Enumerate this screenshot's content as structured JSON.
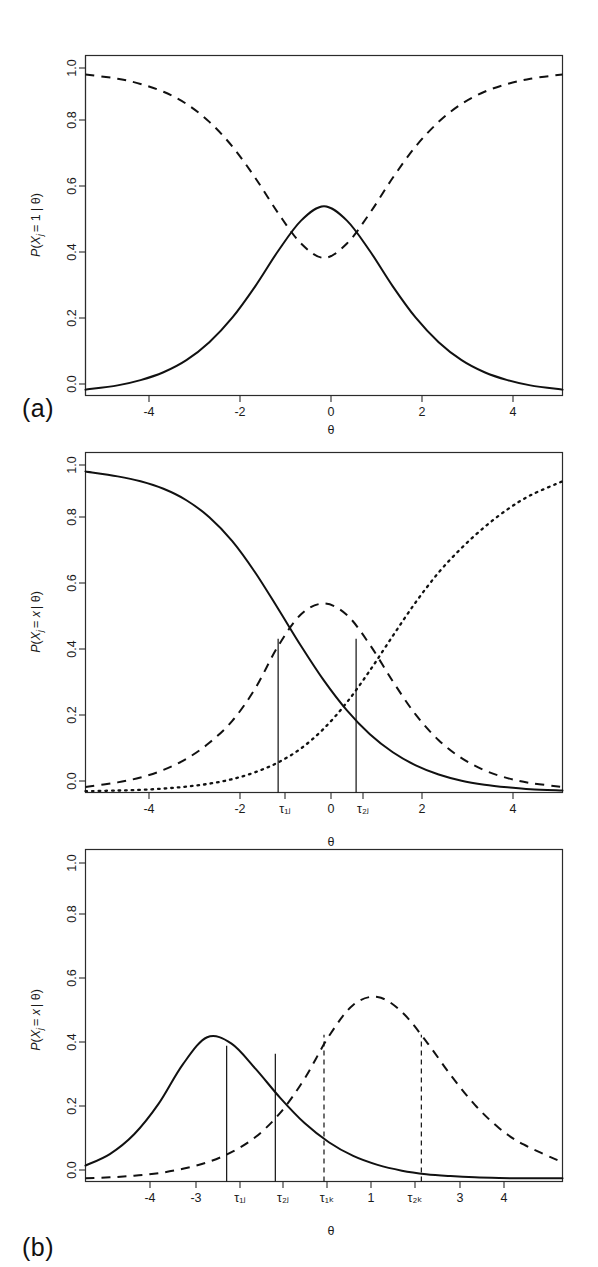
{
  "figure": {
    "panels": [
      {
        "tag": "(a)",
        "ylabel": "P(Xⱼ = 1 | θ)",
        "xlabel": "θ",
        "xticks": [
          "-4",
          "-2",
          "0",
          "2",
          "4"
        ],
        "xtick_values": [
          -4,
          -2,
          0,
          2,
          4
        ],
        "yticks": [
          "0.0",
          "0.2",
          "0.4",
          "0.6",
          "0.8",
          "1.0"
        ],
        "ytick_values": [
          0.0,
          0.2,
          0.4,
          0.6,
          0.8,
          1.0
        ]
      },
      {
        "tag": "(b)",
        "ylabel": "P(Xⱼ = x | θ)",
        "xlabel": "θ",
        "xticks": [
          "-4",
          "-2",
          "τ₁ⱼ",
          "0",
          "τ₂ⱼ",
          "2",
          "4"
        ],
        "xtick_values": [
          -4,
          -2,
          -1,
          0,
          0.7,
          2,
          4
        ],
        "yticks": [
          "0.0",
          "0.2",
          "0.4",
          "0.6",
          "0.8",
          "1.0"
        ],
        "ytick_values": [
          0.0,
          0.2,
          0.4,
          0.6,
          0.8,
          1.0
        ]
      },
      {
        "tag": "(c)",
        "ylabel": "P(Xⱼ = x | θ)",
        "xlabel": "θ",
        "xticks": [
          "-4",
          "-3",
          "τ₁ⱼ",
          "τ₂ⱼ",
          "τ₁ₖ",
          "1",
          "τ₂ₖ",
          "3",
          "4"
        ],
        "xtick_values": [
          -4,
          -3,
          -2,
          -1,
          0,
          1,
          2,
          3,
          4
        ],
        "yticks": [
          "0.0",
          "0.2",
          "0.4",
          "0.6",
          "0.8",
          "1.0"
        ],
        "ytick_values": [
          0.0,
          0.2,
          0.4,
          0.6,
          0.8,
          1.0
        ]
      }
    ]
  },
  "chart_data": [
    {
      "type": "line",
      "panel": "(a)",
      "title": "",
      "xlabel": "θ",
      "ylabel": "P(Xⱼ = 1 | θ)",
      "xlim": [
        -5.2,
        5.2
      ],
      "ylim": [
        0.0,
        1.04
      ],
      "grid": false,
      "legend": "none",
      "series": [
        {
          "name": "category response curve (solid, bell)",
          "style": "solid",
          "model": "normal-like bell, peak 0.58 at theta = 0",
          "x": [
            -5.2,
            -4.5,
            -4,
            -3.5,
            -3,
            -2.5,
            -2,
            -1.5,
            -1,
            -0.5,
            0,
            0.5,
            1,
            1.5,
            2,
            2.5,
            3,
            3.5,
            4,
            4.5,
            5.2
          ],
          "y": [
            0.018,
            0.031,
            0.047,
            0.071,
            0.108,
            0.163,
            0.238,
            0.334,
            0.442,
            0.535,
            0.579,
            0.535,
            0.442,
            0.334,
            0.238,
            0.163,
            0.108,
            0.071,
            0.047,
            0.031,
            0.018
          ]
        },
        {
          "name": "complement curve (dashed, U shape)",
          "style": "dashed",
          "model": "1 minus bell, minimum 0.42 at theta = 0",
          "x": [
            -5.2,
            -4.5,
            -4,
            -3.5,
            -3,
            -2.5,
            -2,
            -1.5,
            -1,
            -0.5,
            0,
            0.5,
            1,
            1.5,
            2,
            2.5,
            3,
            3.5,
            4,
            4.5,
            5.2
          ],
          "y": [
            0.982,
            0.969,
            0.953,
            0.929,
            0.892,
            0.837,
            0.762,
            0.666,
            0.558,
            0.465,
            0.421,
            0.465,
            0.558,
            0.666,
            0.762,
            0.837,
            0.892,
            0.929,
            0.953,
            0.969,
            0.982
          ]
        }
      ]
    },
    {
      "type": "line",
      "panel": "(b)",
      "title": "",
      "xlabel": "θ",
      "ylabel": "P(Xⱼ = x | θ)",
      "xlim": [
        -5.2,
        5.2
      ],
      "ylim": [
        0.0,
        1.04
      ],
      "grid": false,
      "legend": "none",
      "annotations": [
        {
          "label": "τ₁ⱼ",
          "type": "vertical-line",
          "style": "solid",
          "x": -1.0,
          "y_top": 0.47
        },
        {
          "label": "τ₂ⱼ",
          "type": "vertical-line",
          "style": "solid",
          "x": 0.7,
          "y_top": 0.47
        }
      ],
      "series": [
        {
          "name": "P(X=0) decreasing sigmoid (solid)",
          "style": "solid",
          "x": [
            -5.2,
            -4.5,
            -4,
            -3.5,
            -3,
            -2.5,
            -2,
            -1.5,
            -1,
            -0.5,
            0,
            0.5,
            1,
            1.5,
            2,
            2.5,
            3,
            3.5,
            4,
            4.5,
            5.2
          ],
          "y": [
            0.982,
            0.967,
            0.952,
            0.929,
            0.894,
            0.842,
            0.769,
            0.673,
            0.562,
            0.448,
            0.342,
            0.251,
            0.178,
            0.123,
            0.083,
            0.055,
            0.036,
            0.024,
            0.016,
            0.01,
            0.006
          ]
        },
        {
          "name": "P(X=1) middle category (dashed bell)",
          "style": "dashed",
          "x": [
            -5.2,
            -4.5,
            -4,
            -3.5,
            -3,
            -2.5,
            -2,
            -1.5,
            -1,
            -0.5,
            0,
            0.5,
            1,
            1.5,
            2,
            2.5,
            3,
            3.5,
            4,
            4.5,
            5.2
          ],
          "y": [
            0.017,
            0.031,
            0.046,
            0.069,
            0.103,
            0.152,
            0.219,
            0.318,
            0.448,
            0.545,
            0.578,
            0.543,
            0.452,
            0.34,
            0.238,
            0.16,
            0.105,
            0.068,
            0.044,
            0.029,
            0.017
          ]
        },
        {
          "name": "P(X=2) increasing sigmoid (dotted)",
          "style": "dotted",
          "x": [
            -5.2,
            -4.5,
            -4,
            -3.5,
            -3,
            -2.5,
            -2,
            -1.5,
            -1,
            -0.5,
            0,
            0.5,
            1,
            1.5,
            2,
            2.5,
            3,
            3.5,
            4,
            4.5,
            5.2
          ],
          "y": [
            0.004,
            0.006,
            0.008,
            0.012,
            0.018,
            0.027,
            0.041,
            0.062,
            0.092,
            0.135,
            0.196,
            0.276,
            0.373,
            0.479,
            0.582,
            0.673,
            0.748,
            0.812,
            0.866,
            0.909,
            0.952
          ]
        }
      ]
    },
    {
      "type": "line",
      "panel": "(c)",
      "title": "",
      "xlabel": "θ",
      "ylabel": "P(Xⱼ = x | θ)",
      "xlim": [
        -4.9,
        4.9
      ],
      "ylim": [
        0.0,
        1.04
      ],
      "grid": false,
      "legend": "none",
      "annotations": [
        {
          "label": "τ₁ⱼ",
          "type": "vertical-line",
          "style": "solid",
          "x": -2.0,
          "y_top": 0.425
        },
        {
          "label": "τ₂ⱼ",
          "type": "vertical-line",
          "style": "solid",
          "x": -1.0,
          "y_top": 0.4
        },
        {
          "label": "τ₁ₖ",
          "type": "vertical-line",
          "style": "dashed",
          "x": 0.0,
          "y_top": 0.46
        },
        {
          "label": "τ₂ₖ",
          "type": "vertical-line",
          "style": "dashed",
          "x": 2.0,
          "y_top": 0.46
        }
      ],
      "series": [
        {
          "name": "item j middle-category curve (solid bell)",
          "style": "solid",
          "model": "bell, peak 0.452 at theta = -2.4",
          "x": [
            -4.9,
            -4.4,
            -3.9,
            -3.4,
            -2.9,
            -2.4,
            -1.9,
            -1.4,
            -0.9,
            -0.4,
            0.1,
            0.6,
            1.1,
            1.6,
            2.1,
            2.6,
            3.1,
            3.6,
            4.1,
            4.9
          ],
          "y": [
            0.05,
            0.086,
            0.148,
            0.243,
            0.367,
            0.452,
            0.432,
            0.352,
            0.262,
            0.183,
            0.123,
            0.08,
            0.052,
            0.034,
            0.023,
            0.017,
            0.013,
            0.011,
            0.01,
            0.01
          ]
        },
        {
          "name": "item k middle-category curve (dashed bell)",
          "style": "dashed",
          "model": "bell, peak 0.578 at theta = 1.0",
          "x": [
            -4.9,
            -4.4,
            -3.9,
            -3.4,
            -2.9,
            -2.4,
            -1.9,
            -1.4,
            -0.9,
            -0.4,
            0.1,
            0.6,
            1.1,
            1.6,
            2.1,
            2.6,
            3.1,
            3.6,
            4.1,
            4.9
          ],
          "y": [
            0.01,
            0.013,
            0.018,
            0.026,
            0.04,
            0.06,
            0.092,
            0.14,
            0.215,
            0.322,
            0.455,
            0.553,
            0.578,
            0.531,
            0.439,
            0.334,
            0.24,
            0.167,
            0.116,
            0.06
          ]
        }
      ]
    }
  ]
}
